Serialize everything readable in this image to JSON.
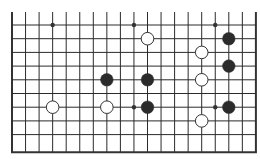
{
  "board": {
    "columns": 19,
    "rows": 10,
    "origin_x": 12,
    "origin_y": 25,
    "spacing_x": 13.55,
    "spacing_y": 13.7,
    "top_line_extension": 13,
    "open_top": true,
    "line_color": "#2a2a2a",
    "edge_color": "#333333",
    "background": "#ffffff",
    "star_points": [
      {
        "col": 3,
        "row": 0
      },
      {
        "col": 9,
        "row": 0
      },
      {
        "col": 15,
        "row": 0
      },
      {
        "col": 9,
        "row": 6
      },
      {
        "col": 15,
        "row": 6
      }
    ]
  },
  "stones": [
    {
      "color": "white",
      "col": 10,
      "row": 1
    },
    {
      "color": "black",
      "col": 16,
      "row": 1
    },
    {
      "color": "white",
      "col": 14,
      "row": 2
    },
    {
      "color": "black",
      "col": 16,
      "row": 3
    },
    {
      "color": "black",
      "col": 7,
      "row": 4
    },
    {
      "color": "black",
      "col": 10,
      "row": 4
    },
    {
      "color": "white",
      "col": 14,
      "row": 4
    },
    {
      "color": "white",
      "col": 3,
      "row": 6
    },
    {
      "color": "white",
      "col": 7,
      "row": 6
    },
    {
      "color": "black",
      "col": 10,
      "row": 6
    },
    {
      "color": "black",
      "col": 16,
      "row": 6
    },
    {
      "color": "white",
      "col": 14,
      "row": 7
    }
  ],
  "colors": {
    "black_stone": "#2b2b2b",
    "white_stone_fill": "#ffffff",
    "white_stone_stroke": "#333333",
    "star_point": "#333333"
  }
}
